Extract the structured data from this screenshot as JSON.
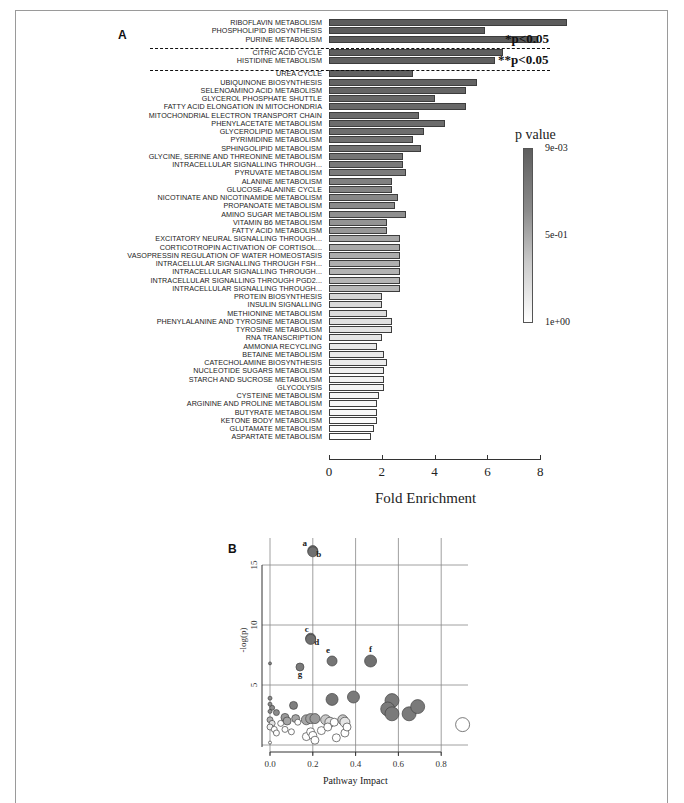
{
  "panels": {
    "a": {
      "letter": "A"
    },
    "b": {
      "letter": "B"
    }
  },
  "chart_data": [
    {
      "type": "bar",
      "orientation": "horizontal",
      "title": "",
      "xlabel": "Fold Enrichment",
      "ylabel": "",
      "xlim": [
        0,
        8
      ],
      "xticks": [
        "0",
        "2",
        "4",
        "6",
        "8"
      ],
      "legend": {
        "title": "p value",
        "labels": [
          "9e-03",
          "5e-01",
          "1e+00"
        ],
        "position": "right",
        "type": "colorbar",
        "colors": [
          "#5e5e5e",
          "#ffffff"
        ]
      },
      "annotations": [
        {
          "text": "*p<0.05",
          "group": "first three pathways"
        },
        {
          "text": "**p<0.05",
          "group": "citric acid cycle, histidine metabolism"
        }
      ],
      "categories": [
        "RIBOFLAVIN METABOLISM",
        "PHOSPHOLIPID BIOSYNTHESIS",
        "PURINE METABOLISM",
        "CITRIC ACID CYCLE",
        "HISTIDINE METABOLISM",
        "UREA CYCLE",
        "UBIQUINONE BIOSYNTHESIS",
        "SELENOAMINO ACID METABOLISM",
        "GLYCEROL PHOSPHATE SHUTTLE",
        "FATTY ACID ELONGATION IN MITOCHONDRIA",
        "MITOCHONDRIAL ELECTRON TRANSPORT CHAIN",
        "PHENYLACETATE METABOLISM",
        "GLYCEROLIPID METABOLISM",
        "PYRIMIDINE METABOLISM",
        "SPHINGOLIPID METABOLISM",
        "GLYCINE, SERINE AND THREONINE METABOLISM",
        "INTRACELLULAR SIGNALLING THROUGH...",
        "PYRUVATE METABOLISM",
        "ALANINE METABOLISM",
        "GLUCOSE-ALANINE CYCLE",
        "NICOTINATE AND NICOTINAMIDE METABOLISM",
        "PROPANOATE METABOLISM",
        "AMINO SUGAR METABOLISM",
        "VITAMIN B6 METABOLISM",
        "FATTY ACID METABOLISM",
        "EXCITATORY NEURAL SIGNALLING THROUGH...",
        "CORTICOTROPIN ACTIVATION OF CORTISOL...",
        "VASOPRESSIN REGULATION OF WATER HOMEOSTASIS",
        "INTRACELLULAR SIGNALLING THROUGH FSH...",
        "INTRACELLULAR SIGNALLING THROUGH...",
        "INTRACELLULAR SIGNALLING THROUGH PGD2...",
        "INTRACELLULAR SIGNALLING THROUGH...",
        "PROTEIN BIOSYNTHESIS",
        "INSULIN SIGNALLING",
        "METHIONINE METABOLISM",
        "PHENYLALANINE AND TYROSINE METABOLISM",
        "TYROSINE METABOLISM",
        "RNA TRANSCRIPTION",
        "AMMONIA RECYCLING",
        "BETAINE METABOLISM",
        "CATECHOLAMINE BIOSYNTHESIS",
        "NUCLEOTIDE SUGARS METABOLISM",
        "STARCH AND SUCROSE METABOLISM",
        "GLYCOLYSIS",
        "CYSTEINE METABOLISM",
        "ARGININE AND PROLINE METABOLISM",
        "BUTYRATE METABOLISM",
        "KETONE BODY METABOLISM",
        "GLUTAMATE METABOLISM",
        "ASPARTATE METABOLISM"
      ],
      "values": [
        9.0,
        5.9,
        7.9,
        6.6,
        6.3,
        3.2,
        5.6,
        5.2,
        4.0,
        5.2,
        3.4,
        4.4,
        3.6,
        3.2,
        3.5,
        2.8,
        2.8,
        2.9,
        2.4,
        2.4,
        2.6,
        2.5,
        2.9,
        2.2,
        2.2,
        2.7,
        2.7,
        2.7,
        2.7,
        2.7,
        2.7,
        2.7,
        2.0,
        2.0,
        2.2,
        2.4,
        2.4,
        2.0,
        1.8,
        2.1,
        2.2,
        2.1,
        2.1,
        2.1,
        1.9,
        1.8,
        1.8,
        1.8,
        1.7,
        1.6
      ],
      "shades": [
        "#5c5c5c",
        "#5c5c5c",
        "#5c5c5c",
        "#5f5f5f",
        "#5f5f5f",
        "#626262",
        "#636363",
        "#656565",
        "#676767",
        "#686868",
        "#6a6a6a",
        "#6c6c6c",
        "#6e6e6e",
        "#717171",
        "#737373",
        "#767676",
        "#797979",
        "#7c7c7c",
        "#808080",
        "#848484",
        "#878787",
        "#8b8b8b",
        "#8f8f8f",
        "#939393",
        "#979797",
        "#a6a6a6",
        "#a9a9a9",
        "#acacac",
        "#afafaf",
        "#b2b2b2",
        "#b5b5b5",
        "#b8b8b8",
        "#d4d4d4",
        "#d8d8d8",
        "#dcdcdc",
        "#dfdfdf",
        "#e2e2e2",
        "#e5e5e5",
        "#e8e8e8",
        "#eaeaea",
        "#ececec",
        "#efefef",
        "#f1f1f1",
        "#f3f3f3",
        "#f5f5f5",
        "#f7f7f7",
        "#f9f9f9",
        "#fbfbfb",
        "#fdfdfd",
        "#ffffff"
      ]
    },
    {
      "type": "scatter",
      "title": "",
      "xlabel": "Pathway Impact",
      "ylabel": "-log(p)",
      "xlim": [
        0.0,
        0.9
      ],
      "ylim": [
        0,
        17
      ],
      "xticks": [
        "0.0",
        "0.2",
        "0.4",
        "0.6",
        "0.8"
      ],
      "yticks": [
        "5",
        "10",
        "15"
      ],
      "grid": true,
      "point_labels": [
        "a",
        "b",
        "c",
        "d",
        "e",
        "f",
        "g"
      ],
      "points": [
        {
          "x": 0.2,
          "y": 16.2,
          "r": 5,
          "fill": "#707070",
          "label": "a"
        },
        {
          "x": 0.2,
          "y": 16.1,
          "r": 5,
          "fill": "#707070",
          "label": "b"
        },
        {
          "x": 0.19,
          "y": 8.9,
          "r": 5,
          "fill": "#707070",
          "label": "c"
        },
        {
          "x": 0.19,
          "y": 8.8,
          "r": 5,
          "fill": "#707070",
          "label": "d"
        },
        {
          "x": 0.29,
          "y": 7.0,
          "r": 5,
          "fill": "#757575",
          "label": "e"
        },
        {
          "x": 0.47,
          "y": 7.0,
          "r": 6,
          "fill": "#707070",
          "label": "f"
        },
        {
          "x": 0.14,
          "y": 6.5,
          "r": 4,
          "fill": "#7a7a7a",
          "label": "g"
        },
        {
          "x": 0.0,
          "y": 6.8,
          "r": 1.5,
          "fill": "#808080"
        },
        {
          "x": 0.29,
          "y": 3.8,
          "r": 6,
          "fill": "#757575"
        },
        {
          "x": 0.39,
          "y": 4.0,
          "r": 6,
          "fill": "#7a7a7a"
        },
        {
          "x": 0.57,
          "y": 3.7,
          "r": 7,
          "fill": "#7a7a7a"
        },
        {
          "x": 0.55,
          "y": 3.0,
          "r": 7,
          "fill": "#7a7a7a"
        },
        {
          "x": 0.57,
          "y": 2.6,
          "r": 7,
          "fill": "#7a7a7a"
        },
        {
          "x": 0.65,
          "y": 2.6,
          "r": 7,
          "fill": "#7a7a7a"
        },
        {
          "x": 0.69,
          "y": 3.2,
          "r": 7,
          "fill": "#7a7a7a"
        },
        {
          "x": 0.9,
          "y": 1.7,
          "r": 7,
          "fill": "#ffffff"
        },
        {
          "x": 0.11,
          "y": 3.3,
          "r": 4,
          "fill": "#7f7f7f"
        },
        {
          "x": 0.0,
          "y": 3.9,
          "r": 2,
          "fill": "#8a8a8a"
        },
        {
          "x": 0.0,
          "y": 3.4,
          "r": 2,
          "fill": "#8a8a8a"
        },
        {
          "x": 0.01,
          "y": 3.1,
          "r": 2.5,
          "fill": "#8a8a8a"
        },
        {
          "x": 0.03,
          "y": 2.7,
          "r": 3,
          "fill": "#8a8a8a"
        },
        {
          "x": 0.0,
          "y": 2.8,
          "r": 2,
          "fill": "#8a8a8a"
        },
        {
          "x": 0.07,
          "y": 2.3,
          "r": 4,
          "fill": "#999999"
        },
        {
          "x": 0.08,
          "y": 2.0,
          "r": 4,
          "fill": "#a5a5a5"
        },
        {
          "x": 0.12,
          "y": 2.2,
          "r": 4,
          "fill": "#a5a5a5"
        },
        {
          "x": 0.17,
          "y": 2.1,
          "r": 5,
          "fill": "#a5a5a5"
        },
        {
          "x": 0.19,
          "y": 2.2,
          "r": 5,
          "fill": "#a0a0a0"
        },
        {
          "x": 0.21,
          "y": 2.2,
          "r": 5,
          "fill": "#9a9a9a"
        },
        {
          "x": 0.26,
          "y": 2.1,
          "r": 5,
          "fill": "#c8c8c8"
        },
        {
          "x": 0.28,
          "y": 1.9,
          "r": 5,
          "fill": "#dddddd"
        },
        {
          "x": 0.34,
          "y": 2.1,
          "r": 5,
          "fill": "#c8c8c8"
        },
        {
          "x": 0.35,
          "y": 1.9,
          "r": 5,
          "fill": "#e5e5e5"
        },
        {
          "x": 0.0,
          "y": 2.1,
          "r": 3,
          "fill": "#b0b0b0"
        },
        {
          "x": 0.01,
          "y": 1.8,
          "r": 3,
          "fill": "#e0e0e0"
        },
        {
          "x": 0.0,
          "y": 1.5,
          "r": 3,
          "fill": "#f0f0f0"
        },
        {
          "x": 0.02,
          "y": 1.3,
          "r": 3,
          "fill": "#ffffff"
        },
        {
          "x": 0.03,
          "y": 1.0,
          "r": 3,
          "fill": "#ffffff"
        },
        {
          "x": 0.05,
          "y": 1.8,
          "r": 3,
          "fill": "#ffffff"
        },
        {
          "x": 0.07,
          "y": 1.3,
          "r": 3,
          "fill": "#ffffff"
        },
        {
          "x": 0.1,
          "y": 1.1,
          "r": 3,
          "fill": "#ffffff"
        },
        {
          "x": 0.13,
          "y": 1.9,
          "r": 3,
          "fill": "#ffffff"
        },
        {
          "x": 0.17,
          "y": 0.7,
          "r": 4,
          "fill": "#ffffff"
        },
        {
          "x": 0.19,
          "y": 1.1,
          "r": 4,
          "fill": "#ffffff"
        },
        {
          "x": 0.2,
          "y": 0.8,
          "r": 4,
          "fill": "#ffffff"
        },
        {
          "x": 0.21,
          "y": 0.4,
          "r": 4,
          "fill": "#ffffff"
        },
        {
          "x": 0.24,
          "y": 1.2,
          "r": 4,
          "fill": "#ffffff"
        },
        {
          "x": 0.27,
          "y": 1.5,
          "r": 4,
          "fill": "#ffffff"
        },
        {
          "x": 0.3,
          "y": 1.9,
          "r": 4,
          "fill": "#ffffff"
        },
        {
          "x": 0.31,
          "y": 0.6,
          "r": 4,
          "fill": "#ffffff"
        },
        {
          "x": 0.35,
          "y": 1.0,
          "r": 4,
          "fill": "#ffffff"
        },
        {
          "x": 0.36,
          "y": 1.5,
          "r": 4,
          "fill": "#ffffff"
        },
        {
          "x": 0.0,
          "y": 0.2,
          "r": 1.5,
          "fill": "#ffffff"
        }
      ]
    }
  ]
}
